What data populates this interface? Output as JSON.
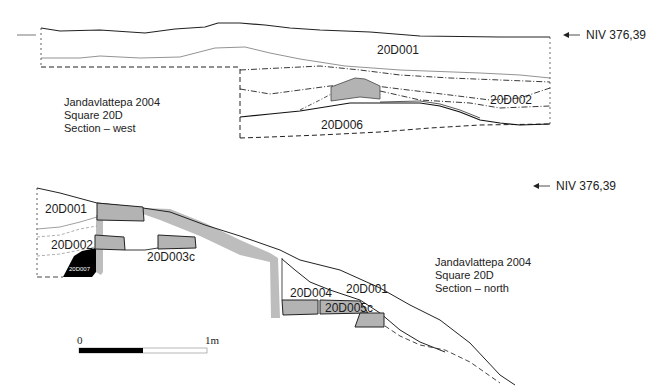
{
  "west_section": {
    "caption": [
      "Jandavlattepa  2004",
      "Square 20D",
      "Section – west"
    ],
    "level_marker": "NIV 376,39",
    "layers": [
      "20D001",
      "20D002",
      "20D006"
    ]
  },
  "north_section": {
    "caption": [
      "Jandavlattepa  2004",
      "Square 20D",
      "Section – north"
    ],
    "level_marker": "NIV 376,39",
    "layers": [
      "20D001",
      "20D002",
      "20D007",
      "20D003c",
      "20D004",
      "20D001",
      "20D005c"
    ]
  },
  "scale_bar": {
    "start": "0",
    "end": "1m"
  },
  "colors": {
    "stone": "#b3b3b3",
    "wall_band": "#bdbdbd",
    "black_fill": "#000000",
    "line": "#1a1a1a"
  }
}
